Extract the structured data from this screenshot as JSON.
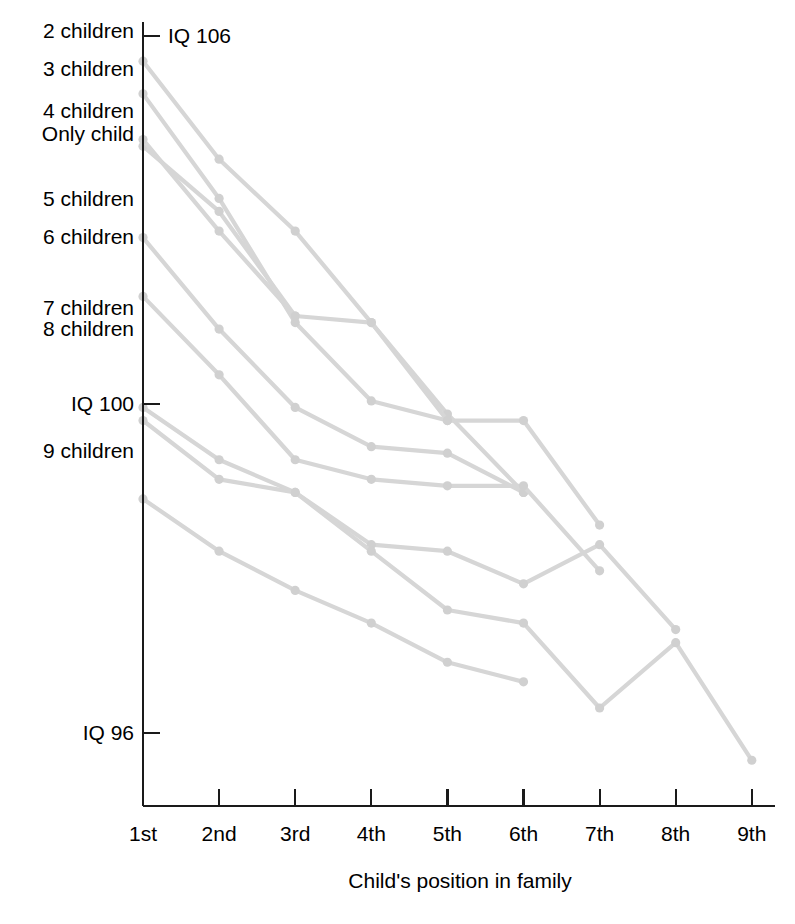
{
  "chart_data": {
    "type": "line",
    "title": "",
    "xlabel": "Child's position in family",
    "ylabel": "",
    "categories": [
      "1st",
      "2nd",
      "3rd",
      "4th",
      "5th",
      "6th",
      "7th",
      "8th",
      "9th"
    ],
    "x": [
      1,
      2,
      3,
      4,
      5,
      6,
      7,
      8,
      9
    ],
    "ylim": [
      94.6,
      106.6
    ],
    "yticks": [
      {
        "value": 106,
        "label": "IQ 106"
      },
      {
        "value": 100,
        "label": "IQ 100"
      },
      {
        "value": 96,
        "label": "IQ 96"
      }
    ],
    "grid": false,
    "legend_position": "left-axis-labels",
    "line_color": "#d6d6d6",
    "marker_color": "#d0d0d0",
    "axis_color": "#1a1a1a",
    "annotations": [
      {
        "text": "IQ 106",
        "x": 1,
        "y": 106
      }
    ],
    "series": [
      {
        "name": "Only child",
        "label": "Only child",
        "x": [
          1,
          2,
          3
        ],
        "values": [
          104.7,
          103.7,
          102.1
        ]
      },
      {
        "name": "2 children",
        "label": "2 children",
        "x": [
          1,
          2,
          3,
          4,
          5,
          6
        ],
        "values": [
          106.0,
          104.5,
          103.4,
          102.0,
          100.6,
          99.4
        ]
      },
      {
        "name": "3 children",
        "label": "3 children",
        "x": [
          1,
          2,
          3,
          4,
          5,
          6,
          7
        ],
        "values": [
          105.5,
          103.9,
          102.0,
          100.8,
          100.5,
          100.5,
          98.9
        ]
      },
      {
        "name": "4 children",
        "label": "4 children",
        "x": [
          1,
          2,
          3,
          4,
          5
        ],
        "values": [
          104.8,
          103.4,
          102.1,
          102.0,
          100.5
        ]
      },
      {
        "name": "5 children",
        "label": "5 children",
        "x": [
          1,
          2,
          3,
          4,
          5,
          6
        ],
        "values": [
          103.3,
          101.9,
          100.7,
          100.1,
          100.0,
          99.4
        ]
      },
      {
        "name": "6 children",
        "label": "6 children",
        "x": [
          1,
          2,
          3,
          4,
          5,
          6,
          7
        ],
        "values": [
          102.4,
          101.2,
          99.9,
          99.6,
          99.5,
          99.5,
          98.2
        ]
      },
      {
        "name": "7 children",
        "label": "7 children",
        "x": [
          1,
          2,
          3,
          4,
          5,
          6,
          7,
          8
        ],
        "values": [
          100.7,
          99.9,
          99.4,
          98.6,
          98.5,
          98.0,
          98.6,
          97.3
        ]
      },
      {
        "name": "8 children",
        "label": "8 children",
        "x": [
          1,
          2,
          3,
          4,
          5,
          6,
          7,
          8,
          9
        ],
        "values": [
          100.5,
          99.6,
          99.4,
          98.5,
          97.6,
          97.4,
          96.1,
          97.1,
          95.3
        ]
      },
      {
        "name": "9 children",
        "label": "9 children",
        "x": [
          1,
          2,
          3,
          4,
          5,
          6
        ],
        "values": [
          99.3,
          98.5,
          97.9,
          97.4,
          96.8,
          96.5
        ]
      }
    ],
    "y_axis_series_labels": [
      {
        "label": "2 children",
        "y_px": 30
      },
      {
        "label": "3 children",
        "y_px": 68
      },
      {
        "label": "4 children",
        "y_px": 110
      },
      {
        "label": "Only child",
        "y_px": 133
      },
      {
        "label": "5 children",
        "y_px": 198
      },
      {
        "label": "6 children",
        "y_px": 236
      },
      {
        "label": "7 children",
        "y_px": 307
      },
      {
        "label": "8 children",
        "y_px": 328
      },
      {
        "label": "9 children",
        "y_px": 450
      }
    ]
  }
}
